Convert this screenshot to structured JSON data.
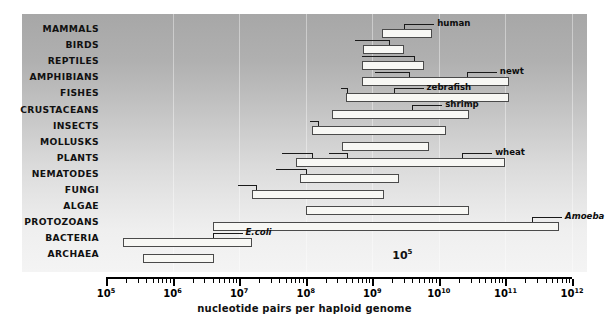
{
  "chart_data": {
    "type": "bar",
    "title": "",
    "xlabel": "nucleotide pairs per haploid genome",
    "ylabel": "",
    "xscale": "log",
    "xlim": [
      5,
      12
    ],
    "grid": true,
    "legend": "none",
    "axis_ticks": [
      {
        "label": "10",
        "exp": "5",
        "value": 5
      },
      {
        "label": "10",
        "exp": "6",
        "value": 6
      },
      {
        "label": "10",
        "exp": "7",
        "value": 7
      },
      {
        "label": "10",
        "exp": "8",
        "value": 8
      },
      {
        "label": "10",
        "exp": "9",
        "value": 9
      },
      {
        "label": "10",
        "exp": "10",
        "value": 10
      },
      {
        "label": "10",
        "exp": "11",
        "value": 11
      },
      {
        "label": "10",
        "exp": "12",
        "value": 12
      }
    ],
    "categories": [
      "MAMMALS",
      "BIRDS",
      "REPTILES",
      "AMPHIBIANS",
      "FISHES",
      "CRUSTACEANS",
      "INSECTS",
      "MOLLUSKS",
      "PLANTS",
      "NEMATODES",
      "FUNGI",
      "ALGAE",
      "PROTOZOANS",
      "BACTERIA",
      "ARCHAEA"
    ],
    "ranges": [
      {
        "group": "MAMMALS",
        "min_log": 9.15,
        "max_log": 9.9
      },
      {
        "group": "BIRDS",
        "min_log": 8.86,
        "max_log": 9.47
      },
      {
        "group": "REPTILES",
        "min_log": 8.84,
        "max_log": 9.77
      },
      {
        "group": "AMPHIBIANS",
        "min_log": 8.85,
        "max_log": 11.05
      },
      {
        "group": "FISHES",
        "min_log": 8.6,
        "max_log": 11.05
      },
      {
        "group": "CRUSTACEANS",
        "min_log": 8.4,
        "max_log": 10.45
      },
      {
        "group": "INSECTS",
        "min_log": 8.1,
        "max_log": 10.1
      },
      {
        "group": "MOLLUSKS",
        "min_log": 8.55,
        "max_log": 9.85
      },
      {
        "group": "PLANTS",
        "min_log": 7.85,
        "max_log": 11.0
      },
      {
        "group": "NEMATODES",
        "min_log": 7.92,
        "max_log": 9.4
      },
      {
        "group": "FUNGI",
        "min_log": 7.2,
        "max_log": 9.18
      },
      {
        "group": "ALGAE",
        "min_log": 8.0,
        "max_log": 10.45
      },
      {
        "group": "PROTOZOANS",
        "min_log": 6.6,
        "max_log": 11.8
      },
      {
        "group": "BACTERIA",
        "min_log": 5.25,
        "max_log": 7.2
      },
      {
        "group": "ARCHAEA",
        "min_log": 5.55,
        "max_log": 6.62
      }
    ],
    "organism_callouts": [
      {
        "name": "human",
        "group": "MAMMALS",
        "log": 9.48,
        "italic": false,
        "side": "right"
      },
      {
        "name": "chicken",
        "group": "BIRDS",
        "log": 9.25,
        "italic": false,
        "side": "left"
      },
      {
        "name": "saltwater crocodile",
        "group": "REPTILES",
        "log": 9.62,
        "italic": false,
        "side": "left"
      },
      {
        "name": "frog",
        "group": "AMPHIBIANS",
        "log": 9.55,
        "italic": false,
        "side": "left"
      },
      {
        "name": "newt",
        "group": "AMPHIBIANS",
        "log": 10.42,
        "italic": false,
        "side": "right"
      },
      {
        "name": "Fugu",
        "group": "FISHES",
        "log": 8.62,
        "italic": true,
        "side": "left"
      },
      {
        "name": "zebrafish",
        "group": "FISHES",
        "log": 9.32,
        "italic": false,
        "side": "right"
      },
      {
        "name": "shrimp",
        "group": "CRUSTACEANS",
        "log": 9.6,
        "italic": false,
        "side": "right"
      },
      {
        "name": "Drosophila",
        "group": "INSECTS",
        "log": 8.18,
        "italic": true,
        "side": "left"
      },
      {
        "name": "Arabidopsis",
        "group": "PLANTS",
        "log": 8.1,
        "italic": true,
        "side": "left"
      },
      {
        "name": "rice",
        "group": "PLANTS",
        "log": 8.62,
        "italic": false,
        "side": "left"
      },
      {
        "name": "wheat",
        "group": "PLANTS",
        "log": 10.35,
        "italic": false,
        "side": "right"
      },
      {
        "name": "C.elegans",
        "group": "NEMATODES",
        "log": 8.0,
        "italic": true,
        "side": "left"
      },
      {
        "name": "yeast",
        "group": "FUNGI",
        "log": 7.25,
        "italic": false,
        "side": "left"
      },
      {
        "name": "Amoeba",
        "group": "PROTOZOANS",
        "log": 11.4,
        "italic": true,
        "side": "right"
      },
      {
        "name": "E.coli",
        "group": "BACTERIA",
        "log": 6.6,
        "italic": true,
        "side": "right"
      }
    ],
    "floating_annotation": {
      "label": "10",
      "exp": "5",
      "log_x": 9.3,
      "row_index": 14
    }
  }
}
